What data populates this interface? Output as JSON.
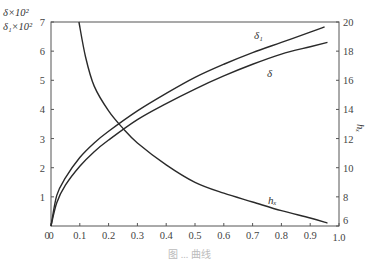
{
  "chart_data": {
    "type": "line",
    "title": "",
    "xlabel": "",
    "ylabel_left": [
      "δ×10²",
      "δ₁×10²"
    ],
    "ylabel_right": "hₓ",
    "xlim": [
      0,
      1.0
    ],
    "ylim_left": [
      0,
      7
    ],
    "ylim_right": [
      6,
      20
    ],
    "x_ticks": [
      "0",
      "0.1",
      "0.2",
      "0.3",
      "0.4",
      "0.5",
      "0.6",
      "0.7",
      "0.8",
      "0.9",
      "1.0"
    ],
    "y_ticks_left": [
      "1",
      "2",
      "3",
      "4",
      "5",
      "6",
      "7"
    ],
    "y_ticks_right": [
      "6",
      "8",
      "10",
      "12",
      "14",
      "16",
      "18",
      "20"
    ],
    "grid": false,
    "legend": "inline curve labels",
    "series": [
      {
        "name": "δ₁",
        "axis": "left",
        "x": [
          0.0,
          0.02,
          0.05,
          0.1,
          0.15,
          0.2,
          0.3,
          0.4,
          0.5,
          0.6,
          0.7,
          0.8,
          0.9,
          0.95
        ],
        "y": [
          0.0,
          1.05,
          1.65,
          2.35,
          2.85,
          3.25,
          3.95,
          4.55,
          5.1,
          5.55,
          5.95,
          6.3,
          6.65,
          6.83
        ]
      },
      {
        "name": "δ",
        "axis": "left",
        "x": [
          0.0,
          0.02,
          0.05,
          0.1,
          0.15,
          0.2,
          0.3,
          0.4,
          0.5,
          0.6,
          0.7,
          0.8,
          0.9,
          0.96
        ],
        "y": [
          0.0,
          0.8,
          1.4,
          2.05,
          2.55,
          2.95,
          3.65,
          4.2,
          4.7,
          5.15,
          5.55,
          5.9,
          6.15,
          6.3
        ]
      },
      {
        "name": "hₓ",
        "axis": "right",
        "x": [
          0.097,
          0.12,
          0.15,
          0.2,
          0.25,
          0.3,
          0.4,
          0.5,
          0.6,
          0.7,
          0.8,
          0.9,
          0.96
        ],
        "y": [
          20.0,
          17.6,
          15.6,
          13.9,
          12.7,
          11.7,
          10.2,
          9.0,
          8.25,
          7.65,
          7.05,
          6.55,
          6.2
        ]
      }
    ],
    "annotations": [
      {
        "text": "δ₁",
        "x": 0.72,
        "y_left": 6.5
      },
      {
        "text": "δ",
        "x": 0.76,
        "y_left": 5.3
      },
      {
        "text": "hₓ",
        "x": 0.77,
        "y_left": 0.9
      }
    ]
  },
  "labels": {
    "left_axis_line1": "δ×10²",
    "left_axis_line2": "δ₁×10²",
    "right_axis": "hₓ",
    "curve_delta1": "δ₁",
    "curve_delta": "δ",
    "curve_hx": "hₓ",
    "caption": "图 ... 曲线"
  }
}
